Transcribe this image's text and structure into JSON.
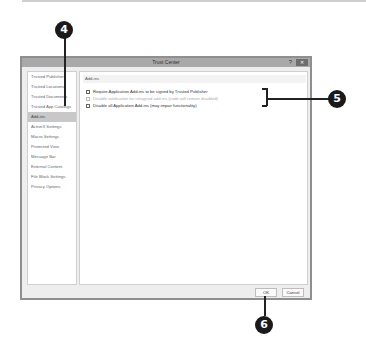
{
  "dialog": {
    "title": "Trust Center",
    "help_glyph": "?",
    "close_glyph": "✕",
    "sidebar": {
      "items": [
        {
          "label": "Trusted Publishers"
        },
        {
          "label": "Trusted Locations"
        },
        {
          "label": "Trusted Documents"
        },
        {
          "label": "Trusted App Catalogs"
        },
        {
          "label": "Add-ins",
          "active": true
        },
        {
          "label": "ActiveX Settings"
        },
        {
          "label": "Macro Settings"
        },
        {
          "label": "Protected View"
        },
        {
          "label": "Message Bar"
        },
        {
          "label": "External Content"
        },
        {
          "label": "File Block Settings"
        },
        {
          "label": "Privacy Options"
        }
      ]
    },
    "content": {
      "section_title": "Add-ins",
      "options": [
        {
          "label": "Require Application Add-ins to be signed by Trusted Publisher",
          "checked": false,
          "disabled": false
        },
        {
          "label": "Disable notification for unsigned add-ins (code will remain disabled)",
          "checked": false,
          "disabled": true
        },
        {
          "label": "Disable all Application Add-ins (may impair functionality)",
          "checked": false,
          "disabled": false
        }
      ]
    },
    "buttons": {
      "ok": "OK",
      "cancel": "Cancel"
    }
  },
  "callouts": {
    "c4": "4",
    "c5": "5",
    "c6": "6"
  }
}
